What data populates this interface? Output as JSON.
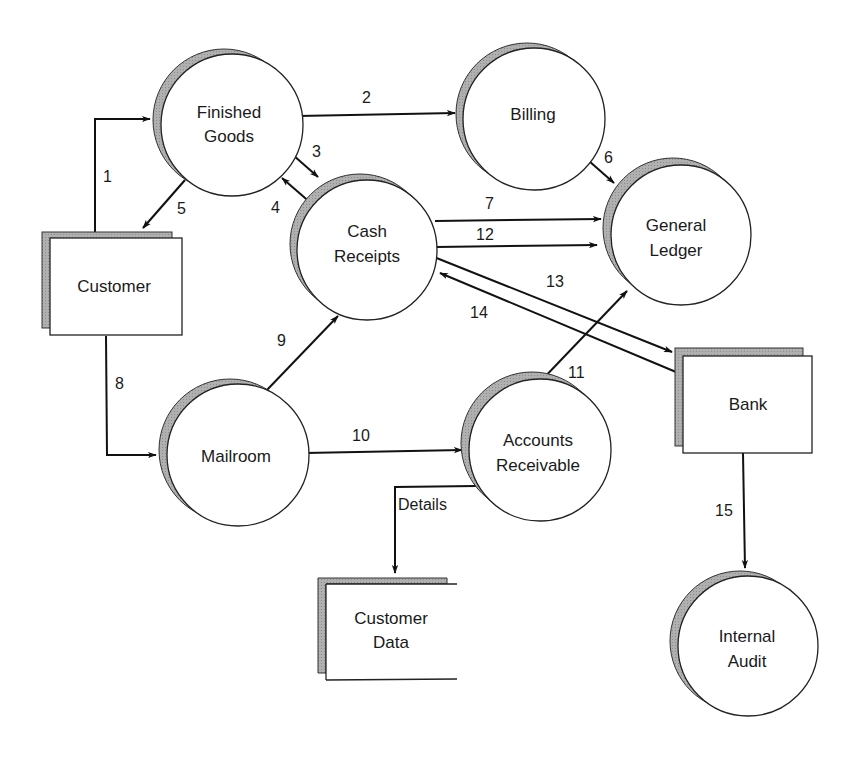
{
  "diagram": {
    "type": "data-flow-diagram",
    "colors": {
      "line": "#111111",
      "shadow": "#a9a9a9",
      "fill": "#ffffff",
      "text": "#1a1a1a"
    },
    "processes": [
      {
        "id": "finished_goods",
        "line1": "Finished",
        "line2": "Goods"
      },
      {
        "id": "billing",
        "line1": "Billing",
        "line2": ""
      },
      {
        "id": "cash_receipts",
        "line1": "Cash",
        "line2": "Receipts"
      },
      {
        "id": "general_ledger",
        "line1": "General",
        "line2": "Ledger"
      },
      {
        "id": "mailroom",
        "line1": "Mailroom",
        "line2": ""
      },
      {
        "id": "accounts_receivable",
        "line1": "Accounts",
        "line2": "Receivable"
      },
      {
        "id": "internal_audit",
        "line1": "Internal",
        "line2": "Audit"
      }
    ],
    "entities": [
      {
        "id": "customer",
        "label": "Customer"
      },
      {
        "id": "bank",
        "label": "Bank"
      }
    ],
    "data_stores": [
      {
        "id": "customer_data",
        "line1": "Customer",
        "line2": "Data"
      }
    ],
    "flows": [
      {
        "label": "1",
        "from": "Customer",
        "to": "Finished Goods"
      },
      {
        "label": "2",
        "from": "Finished Goods",
        "to": "Billing"
      },
      {
        "label": "3",
        "from": "Finished Goods",
        "to": "Cash Receipts"
      },
      {
        "label": "4",
        "from": "Cash Receipts",
        "to": "Finished Goods"
      },
      {
        "label": "5",
        "from": "Finished Goods",
        "to": "Customer"
      },
      {
        "label": "6",
        "from": "Billing",
        "to": "General Ledger"
      },
      {
        "label": "7",
        "from": "Cash Receipts",
        "to": "General Ledger"
      },
      {
        "label": "8",
        "from": "Customer",
        "to": "Mailroom"
      },
      {
        "label": "9",
        "from": "Mailroom",
        "to": "Cash Receipts"
      },
      {
        "label": "10",
        "from": "Mailroom",
        "to": "Accounts Receivable"
      },
      {
        "label": "11",
        "from": "Accounts Receivable",
        "to": "General Ledger"
      },
      {
        "label": "12",
        "from": "Cash Receipts",
        "to": "General Ledger"
      },
      {
        "label": "13",
        "from": "Cash Receipts",
        "to": "Bank"
      },
      {
        "label": "14",
        "from": "Bank",
        "to": "Cash Receipts"
      },
      {
        "label": "15",
        "from": "Bank",
        "to": "Internal Audit"
      },
      {
        "label": "Details",
        "from": "Accounts Receivable",
        "to": "Customer Data"
      }
    ]
  }
}
